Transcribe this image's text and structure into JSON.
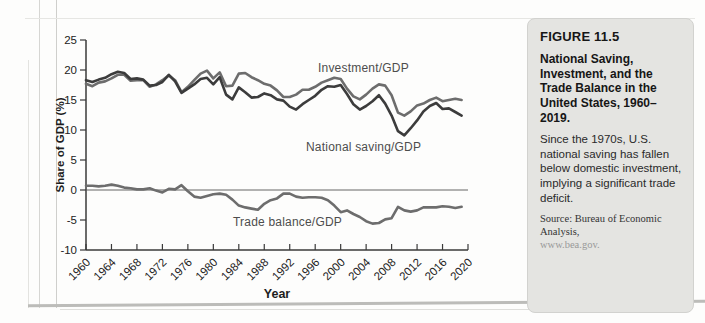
{
  "figure": {
    "label": "FIGURE 11.5",
    "title": "National Saving, Investment, and the Trade Balance in the United States, 1960–2019.",
    "caption": "Since the 1970s, U.S. national saving has fallen below domestic investment, implying a significant trade deficit.",
    "source_prefix": "Source: Bureau of Economic Analysis,",
    "source_link": "www.bea.gov."
  },
  "chart_data": {
    "type": "line",
    "title": "",
    "xlabel": "Year",
    "ylabel": "Share of GDP (%)",
    "xlim": [
      1960,
      2020
    ],
    "ylim": [
      -10,
      25
    ],
    "x_ticks": [
      1960,
      1964,
      1968,
      1972,
      1976,
      1980,
      1984,
      1988,
      1992,
      1996,
      2000,
      2004,
      2008,
      2012,
      2016,
      2020
    ],
    "y_ticks": [
      25,
      20,
      15,
      10,
      5,
      0,
      -5,
      -10
    ],
    "grid": false,
    "zero_line": true,
    "legend_position": "inline-labels",
    "axis_color": "#3a3a3a",
    "x": [
      1960,
      1961,
      1962,
      1963,
      1964,
      1965,
      1966,
      1967,
      1968,
      1969,
      1970,
      1971,
      1972,
      1973,
      1974,
      1975,
      1976,
      1977,
      1978,
      1979,
      1980,
      1981,
      1982,
      1983,
      1984,
      1985,
      1986,
      1987,
      1988,
      1989,
      1990,
      1991,
      1992,
      1993,
      1994,
      1995,
      1996,
      1997,
      1998,
      1999,
      2000,
      2001,
      2002,
      2003,
      2004,
      2005,
      2006,
      2007,
      2008,
      2009,
      2010,
      2011,
      2012,
      2013,
      2014,
      2015,
      2016,
      2017,
      2018,
      2019
    ],
    "series": [
      {
        "name": "Investment/GDP",
        "color": "#6d6d6d",
        "values": [
          17.7,
          17.3,
          17.9,
          18.1,
          18.6,
          19.2,
          19.2,
          18.2,
          18.3,
          18.3,
          17.2,
          17.6,
          18.3,
          19.1,
          18.3,
          16.3,
          17.2,
          18.3,
          19.4,
          19.9,
          18.6,
          19.6,
          17.3,
          17.4,
          19.4,
          19.5,
          18.8,
          18.3,
          17.7,
          17.4,
          16.6,
          15.5,
          15.5,
          15.9,
          16.7,
          16.7,
          17.2,
          17.9,
          18.3,
          18.7,
          18.5,
          16.9,
          15.6,
          15.1,
          15.9,
          16.9,
          17.6,
          17.4,
          15.8,
          12.9,
          12.4,
          13.1,
          14.1,
          14.4,
          15.0,
          15.4,
          14.8,
          15.0,
          15.2,
          15.0
        ]
      },
      {
        "name": "National saving/GDP",
        "color": "#3c3c3c",
        "values": [
          18.3,
          18.0,
          18.4,
          18.7,
          19.3,
          19.7,
          19.5,
          18.5,
          18.6,
          18.4,
          17.4,
          17.5,
          18.0,
          19.2,
          18.1,
          16.2,
          16.9,
          17.6,
          18.5,
          18.7,
          17.6,
          18.8,
          15.9,
          15.1,
          17.1,
          16.3,
          15.4,
          15.5,
          16.1,
          15.8,
          15.1,
          14.9,
          13.9,
          13.4,
          14.3,
          15.0,
          15.7,
          16.7,
          17.3,
          17.2,
          17.5,
          16.0,
          14.3,
          13.4,
          14.0,
          14.8,
          15.8,
          14.4,
          12.4,
          9.8,
          9.1,
          10.3,
          11.6,
          13.1,
          14.0,
          14.5,
          13.5,
          13.6,
          13.0,
          12.4
        ]
      },
      {
        "name": "Trade balance/GDP",
        "color": "#6d6d6d",
        "values": [
          0.7,
          0.7,
          0.6,
          0.7,
          0.9,
          0.7,
          0.4,
          0.3,
          0.1,
          0.1,
          0.3,
          -0.1,
          -0.4,
          0.2,
          0.1,
          0.8,
          -0.2,
          -1.1,
          -1.3,
          -1.0,
          -0.7,
          -0.6,
          -0.8,
          -1.6,
          -2.6,
          -2.9,
          -3.1,
          -3.3,
          -2.3,
          -1.7,
          -1.4,
          -0.6,
          -0.6,
          -1.1,
          -1.3,
          -1.2,
          -1.2,
          -1.3,
          -1.7,
          -2.6,
          -3.7,
          -3.4,
          -4.0,
          -4.5,
          -5.2,
          -5.6,
          -5.5,
          -4.9,
          -4.7,
          -2.8,
          -3.4,
          -3.6,
          -3.4,
          -2.9,
          -2.9,
          -2.9,
          -2.7,
          -2.8,
          -3.0,
          -2.8
        ]
      }
    ]
  }
}
